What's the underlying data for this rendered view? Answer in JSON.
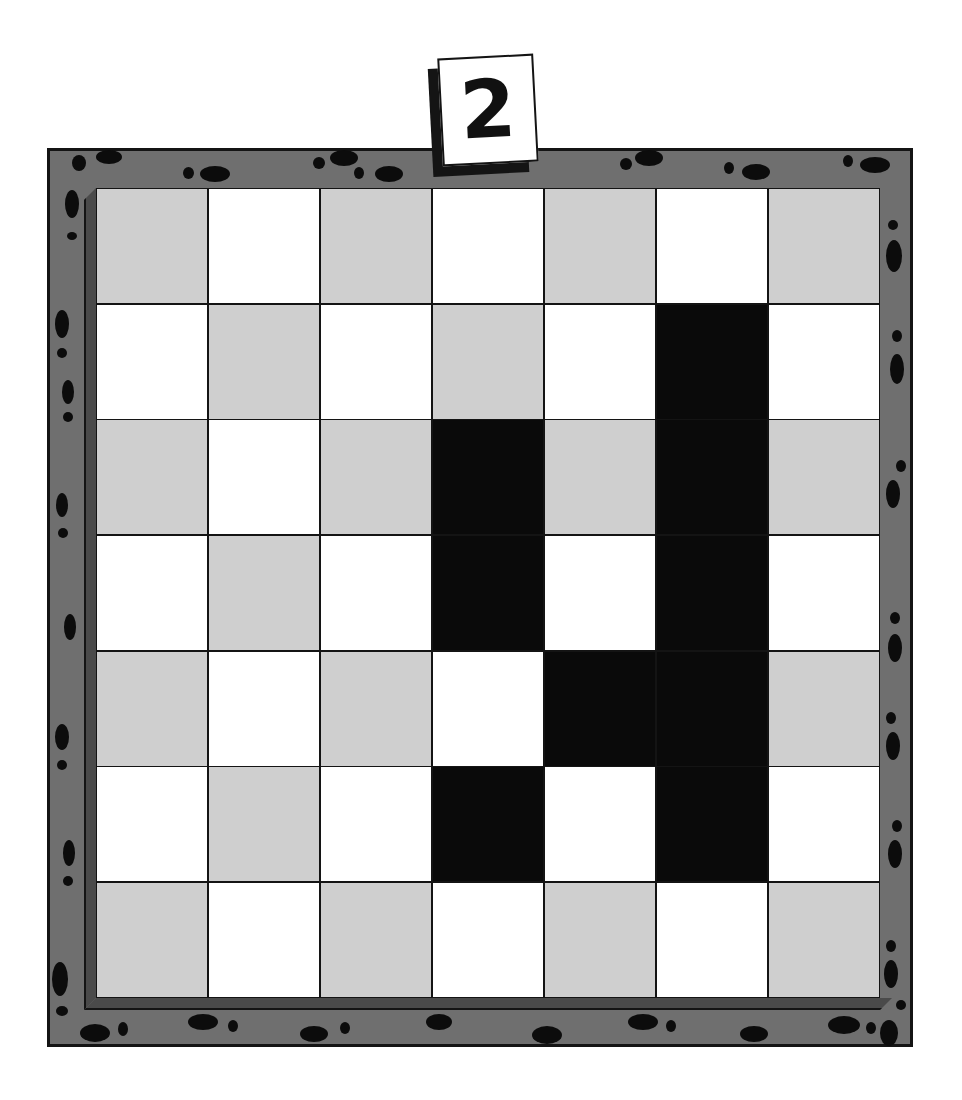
{
  "puzzle": {
    "number": "2",
    "rows": 7,
    "cols": 7,
    "colors": {
      "frame": "#6f6f6f",
      "light": "#ffffff",
      "gray": "#cfcfcf",
      "filled": "#0a0a0a",
      "outline": "#141414"
    },
    "filled_cells": [
      [
        1,
        5
      ],
      [
        2,
        3
      ],
      [
        2,
        5
      ],
      [
        3,
        3
      ],
      [
        3,
        5
      ],
      [
        4,
        4
      ],
      [
        4,
        5
      ],
      [
        5,
        3
      ],
      [
        5,
        5
      ]
    ],
    "pattern": [
      [
        "gray",
        "white",
        "gray",
        "white",
        "gray",
        "white",
        "gray"
      ],
      [
        "white",
        "gray",
        "white",
        "gray",
        "white",
        "black",
        "white"
      ],
      [
        "gray",
        "white",
        "gray",
        "black",
        "gray",
        "black",
        "gray"
      ],
      [
        "white",
        "gray",
        "white",
        "black",
        "white",
        "black",
        "white"
      ],
      [
        "gray",
        "white",
        "gray",
        "white",
        "black",
        "black",
        "gray"
      ],
      [
        "white",
        "gray",
        "white",
        "black",
        "white",
        "black",
        "white"
      ],
      [
        "gray",
        "white",
        "gray",
        "white",
        "gray",
        "white",
        "gray"
      ]
    ]
  }
}
